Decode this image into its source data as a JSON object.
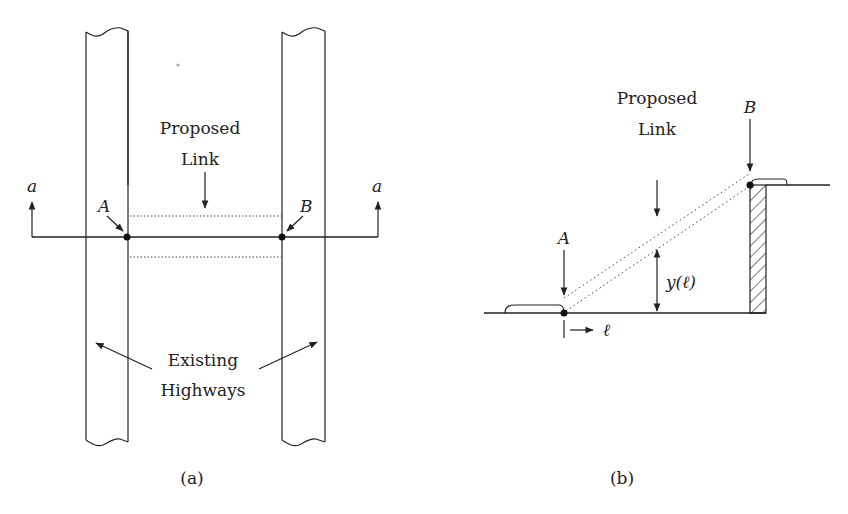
{
  "figure": {
    "panel_a": {
      "caption": "(a)",
      "proposed_label_line1": "Proposed",
      "proposed_label_line2": "Link",
      "existing_label_line1": "Existing",
      "existing_label_line2": "Highways",
      "point_a": "A",
      "point_b": "B",
      "section_left": "a",
      "section_right": "a"
    },
    "panel_b": {
      "caption": "(b)",
      "proposed_label_line1": "Proposed",
      "proposed_label_line2": "Link",
      "point_a": "A",
      "point_b": "B",
      "height_label": "y(ℓ)",
      "distance_label": "ℓ"
    },
    "colors": {
      "line": "#222222",
      "background": "#ffffff"
    }
  }
}
